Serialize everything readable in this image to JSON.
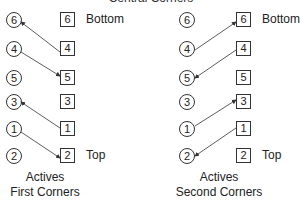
{
  "title_clipped": "Central Corners",
  "left_panel": {
    "circles": [
      "6",
      "4",
      "5",
      "3",
      "1",
      "2"
    ],
    "squares": [
      "6",
      "4",
      "5",
      "3",
      "1",
      "2"
    ],
    "bottom_label": "Bottom",
    "top_label": "Top",
    "caption_line1": "Actives",
    "caption_line2": "First Corners"
  },
  "right_panel": {
    "circles": [
      "6",
      "4",
      "5",
      "3",
      "1",
      "2"
    ],
    "squares": [
      "6",
      "4",
      "5",
      "3",
      "1",
      "2"
    ],
    "bottom_label": "Bottom",
    "top_label": "Top",
    "caption_line1": "Actives",
    "caption_line2": "Second Corners"
  }
}
